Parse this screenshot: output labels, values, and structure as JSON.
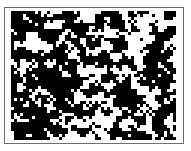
{
  "figure": {
    "frame_color": "#6e6e6e",
    "ink_color": "#000000",
    "background_color": "#ffffff",
    "texture": {
      "width": 167,
      "height": 130,
      "cell": 3,
      "fill_density": 0.62,
      "seed": 7
    }
  }
}
